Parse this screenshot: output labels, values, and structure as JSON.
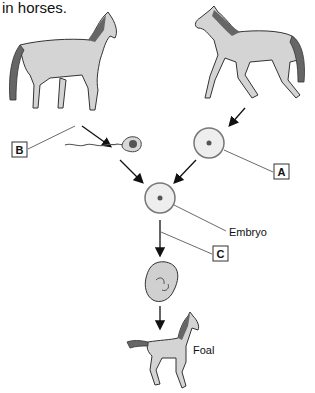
{
  "caption": "in horses.",
  "labels": {
    "a": "A",
    "b": "B",
    "c": "C",
    "embryo": "Embryo",
    "foal": "Foal"
  },
  "figures": {
    "stallion": "stallion",
    "mare": "mare",
    "sperm": "sperm cell",
    "egg": "egg cell",
    "zygote": "fertilized egg",
    "fetus": "fetus",
    "foal": "foal"
  },
  "colors": {
    "horse_fill": "#d4d4d4",
    "mane": "#666666",
    "outline": "#333333",
    "cell_fill": "#eeeeee",
    "nucleus": "#555555"
  }
}
